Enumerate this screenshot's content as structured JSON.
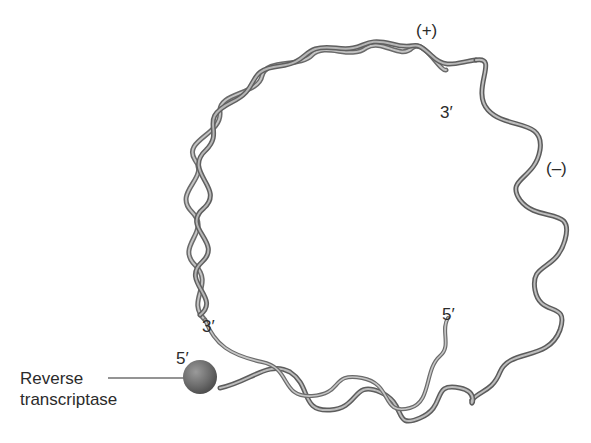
{
  "diagram": {
    "labels": {
      "plus_strand": "(+)",
      "minus_strand": "(–)",
      "plus_three_prime": "3′",
      "minus_three_prime": "3′",
      "minus_five_prime": "5′",
      "plus_five_prime": "5′"
    },
    "callout": {
      "line1": "Reverse",
      "line2": "transcriptase"
    },
    "colors": {
      "ribbon_dark": "#5e5e5e",
      "ribbon_light": "#b9b9b9",
      "ribbon_mid": "#8a8a8a",
      "enzyme_sphere": "#6f6f6f",
      "leader_line": "#2b2b2b",
      "background": "#ffffff"
    }
  }
}
